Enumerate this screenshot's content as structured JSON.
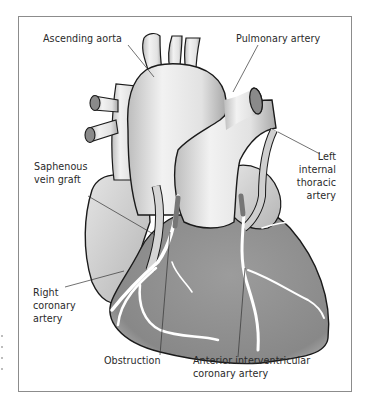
{
  "figure": {
    "labels": {
      "ascending_aorta": "Ascending aorta",
      "pulmonary_artery": "Pulmonary artery",
      "saphenous_vein_graft": [
        "Saphenous",
        "vein graft"
      ],
      "left_internal_thoracic_artery": [
        "Left",
        "internal",
        "thoracic",
        "artery"
      ],
      "right_coronary_artery": [
        "Right",
        "coronary",
        "artery"
      ],
      "obstruction": "Obstruction",
      "anterior_interventricular_coronary_artery": [
        "Anterior interventricular",
        "coronary artery"
      ]
    },
    "colors": {
      "frame": "#8c8c8c",
      "outline": "#1a1a1a",
      "vessel_light": "#e6e6e6",
      "atrium": "#d2d2d2",
      "ventricle": "#8f8f8f",
      "coronary": "#ffffff",
      "obstruction": "#767676",
      "leader_line": "#333333"
    }
  }
}
